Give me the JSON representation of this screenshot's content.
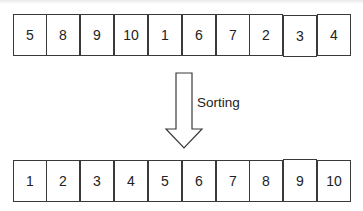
{
  "diagram": {
    "unsorted": {
      "values": [
        "5",
        "8",
        "9",
        "10",
        "1",
        "6",
        "7",
        "2",
        "3",
        "4"
      ]
    },
    "arrow": {
      "label": "Sorting",
      "direction": "down",
      "icon": "down-arrow-icon"
    },
    "sorted": {
      "values": [
        "1",
        "2",
        "3",
        "4",
        "5",
        "6",
        "7",
        "8",
        "9",
        "10"
      ]
    },
    "colors": {
      "border": "#3a3a3a",
      "text": "#222222",
      "background": "#ffffff"
    }
  }
}
